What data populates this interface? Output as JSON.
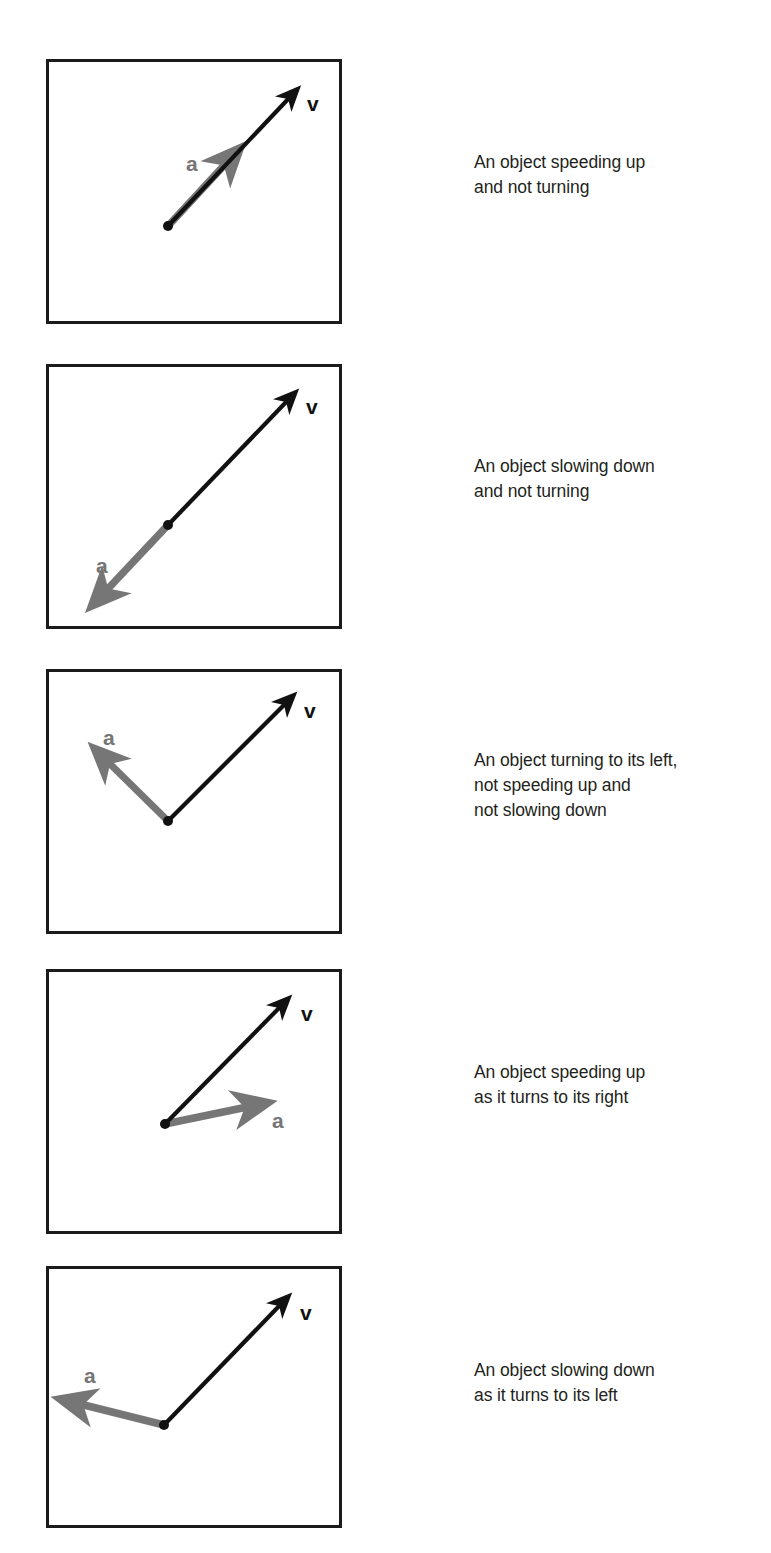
{
  "figure": {
    "colors": {
      "velocity": "#111111",
      "acceleration": "#767676",
      "box_border": "#1b1b1b",
      "caption_text": "#231f20",
      "background": "#ffffff"
    },
    "labels": {
      "velocity": "v",
      "acceleration": "a"
    },
    "panels": [
      {
        "id": "panel-1",
        "box": {
          "x": 46,
          "y": 59,
          "w": 296,
          "h": 265
        },
        "origin": {
          "x": 122,
          "y": 167
        },
        "velocity": {
          "tip_x": 252,
          "tip_y": 30,
          "label": "v",
          "label_x": 261,
          "label_y": 47
        },
        "acceleration": {
          "tip_x": 190,
          "tip_y": 94,
          "label": "a",
          "label_x": 146,
          "label_y": 106
        },
        "caption": {
          "x": 474,
          "y": 150,
          "lines": [
            "An object speeding up",
            "and not turning"
          ]
        }
      },
      {
        "id": "panel-2",
        "box": {
          "x": 46,
          "y": 364,
          "w": 296,
          "h": 265
        },
        "origin": {
          "x": 122,
          "y": 161
        },
        "velocity": {
          "tip_x": 250,
          "tip_y": 28,
          "label": "v",
          "label_x": 260,
          "label_y": 44
        },
        "acceleration": {
          "tip_x": 46,
          "tip_y": 241,
          "label": "a",
          "label_x": 55,
          "label_y": 203
        },
        "caption": {
          "x": 474,
          "y": 454,
          "lines": [
            "An object slowing down",
            "and not turning"
          ]
        }
      },
      {
        "id": "panel-3",
        "box": {
          "x": 46,
          "y": 669,
          "w": 296,
          "h": 265
        },
        "origin": {
          "x": 122,
          "y": 152
        },
        "velocity": {
          "tip_x": 248,
          "tip_y": 26,
          "label": "v",
          "label_x": 258,
          "label_y": 43
        },
        "acceleration": {
          "tip_x": 48,
          "tip_y": 78,
          "label": "a",
          "label_x": 63,
          "label_y": 70
        },
        "caption": {
          "x": 474,
          "y": 748,
          "lines": [
            "An object turning to its left,",
            "not speeding up and",
            "not slowing down"
          ]
        }
      },
      {
        "id": "panel-4",
        "box": {
          "x": 46,
          "y": 969,
          "w": 296,
          "h": 265
        },
        "origin": {
          "x": 119,
          "y": 155
        },
        "velocity": {
          "tip_x": 243,
          "tip_y": 29,
          "label": "v",
          "label_x": 255,
          "label_y": 46
        },
        "acceleration": {
          "tip_x": 221,
          "tip_y": 128,
          "label": "a",
          "label_x": 231,
          "label_y": 152
        },
        "caption": {
          "x": 474,
          "y": 1060,
          "lines": [
            "An object speeding up",
            "as it turns to its right"
          ]
        }
      },
      {
        "id": "panel-5",
        "box": {
          "x": 46,
          "y": 1266,
          "w": 296,
          "h": 262
        },
        "origin": {
          "x": 118,
          "y": 159
        },
        "velocity": {
          "tip_x": 243,
          "tip_y": 30,
          "label": "v",
          "label_x": 254,
          "label_y": 48
        },
        "acceleration": {
          "tip_x": 18,
          "tip_y": 133,
          "label": "a",
          "label_x": 44,
          "label_y": 110
        },
        "caption": {
          "x": 474,
          "y": 1358,
          "lines": [
            "An object slowing down",
            "as it turns to its left"
          ]
        }
      }
    ]
  }
}
